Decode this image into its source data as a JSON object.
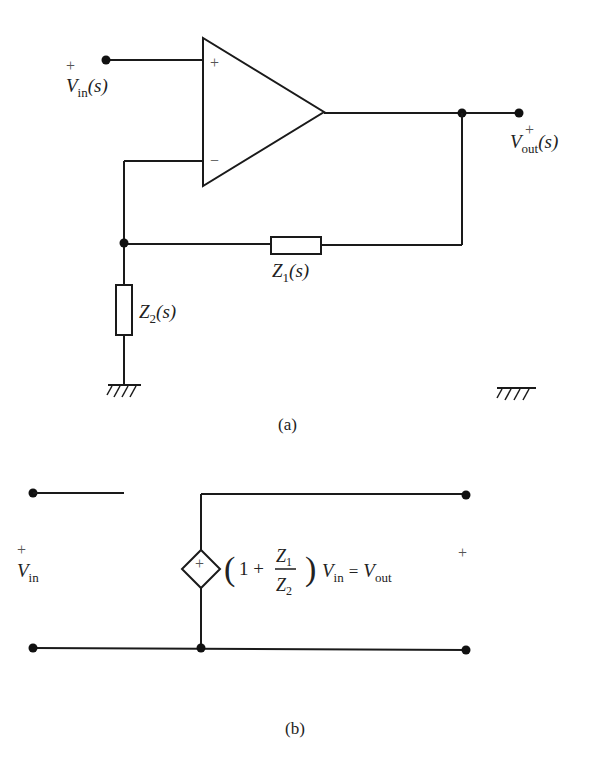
{
  "figure_a": {
    "caption": "(a)",
    "input": {
      "sign": "+",
      "symbol": "V",
      "subscript": "in",
      "arg": "(s)"
    },
    "output": {
      "sign": "+",
      "symbol": "V",
      "subscript": "out",
      "arg": "(s)"
    },
    "opamp": {
      "plus_terminal": "+",
      "minus_terminal": "−"
    },
    "z1": {
      "symbol": "Z",
      "subscript": "1",
      "arg": "(s)"
    },
    "z2": {
      "symbol": "Z",
      "subscript": "2",
      "arg": "(s)"
    }
  },
  "figure_b": {
    "caption": "(b)",
    "input": {
      "sign": "+",
      "symbol": "V",
      "subscript": "in"
    },
    "output_sign": "+",
    "source_sign": "+",
    "equation": {
      "open_paren": "(",
      "one_plus": "1 +",
      "num": "Z",
      "num_sub": "1",
      "den": "Z",
      "den_sub": "2",
      "close_paren": ")",
      "vin": "V",
      "vin_sub": "in",
      "equals": "=",
      "vout": "V",
      "vout_sub": "out"
    }
  }
}
